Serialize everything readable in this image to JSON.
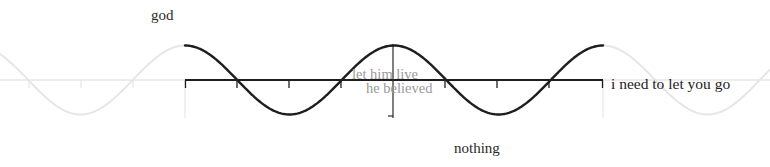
{
  "labels": {
    "top": "god",
    "bottom": "nothing",
    "right": "i need to let you go",
    "center_line_1": "let him live",
    "center_line_2": "he believed"
  },
  "colors": {
    "foreground": "#1e1e1e",
    "faint": "#e6e6e6",
    "center_text": "#9a9a9a"
  },
  "chart_data": {
    "type": "line",
    "title": "",
    "series": [
      {
        "name": "cosine (dark segment)",
        "function": "cos(x)",
        "x_range_periods": [
          0,
          2
        ],
        "key_points": [
          {
            "x": 0,
            "y": 1
          },
          {
            "x": 0.25,
            "y": 0
          },
          {
            "x": 0.5,
            "y": -1
          },
          {
            "x": 0.75,
            "y": 0
          },
          {
            "x": 1,
            "y": 1
          },
          {
            "x": 1.25,
            "y": 0
          },
          {
            "x": 1.5,
            "y": -1
          },
          {
            "x": 1.75,
            "y": 0
          },
          {
            "x": 2,
            "y": 1
          }
        ]
      },
      {
        "name": "cosine (faint continuation)",
        "function": "cos(x)",
        "x_range_periods": [
          -0.9,
          2.8
        ]
      }
    ],
    "x_ticks_periods": [
      0,
      0.25,
      0.5,
      0.75,
      1,
      1.25,
      1.5,
      1.75,
      2
    ],
    "ylim": [
      -1,
      1
    ],
    "annotations": [
      {
        "text": "god",
        "position": "top-left, near maximum"
      },
      {
        "text": "nothing",
        "position": "bottom, near minimum"
      },
      {
        "text": "i need to let you go",
        "position": "right end of axis"
      },
      {
        "text": "let him live",
        "position": "center, on axis"
      },
      {
        "text": "he believed",
        "position": "center, below axis"
      }
    ],
    "grid": false,
    "legend": false
  }
}
